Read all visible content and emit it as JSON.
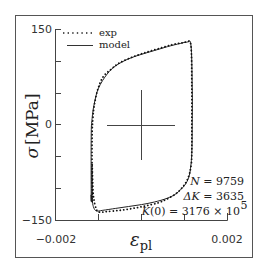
{
  "chart_data": {
    "type": "line",
    "title": "",
    "xlabel": "ε_pl",
    "ylabel": "σ [MPa]",
    "xlim": [
      -0.002,
      0.002
    ],
    "ylim": [
      -150,
      150
    ],
    "x_ticks": [
      -0.002,
      -0.001,
      0,
      0.001,
      0.002
    ],
    "x_tick_labels": [
      "−0.002",
      "0.002"
    ],
    "y_ticks": [
      150,
      100,
      50,
      0,
      -50,
      -100,
      -150
    ],
    "y_tick_labels": [
      "150",
      "0",
      "−150"
    ],
    "grid": false,
    "legend_position": "upper left",
    "series": [
      {
        "name": "exp",
        "style": "dotted",
        "x": [
          -0.00115,
          -0.00115,
          -0.00113,
          -0.0011,
          -0.00102,
          -0.0009,
          -0.0007,
          -0.0005,
          -0.0002,
          0.0001,
          0.0004,
          0.0007,
          0.00095,
          0.00105,
          0.00115,
          0.00117,
          0.00117,
          0.00117,
          0.00116,
          0.00112,
          0.00105,
          0.00095,
          0.0008,
          0.0006,
          0.0004,
          0.0001,
          -0.0002,
          -0.0005,
          -0.0008,
          -0.00098,
          -0.00105,
          -0.00112,
          -0.00115
        ],
        "y": [
          -120,
          -20,
          10,
          30,
          55,
          75,
          88,
          98,
          107,
          114,
          120,
          126,
          129,
          130,
          125,
          60,
          0,
          -40,
          -60,
          -75,
          -88,
          -98,
          -108,
          -116,
          -122,
          -127,
          -131,
          -134,
          -136,
          -137,
          -132,
          -110,
          -60
        ]
      },
      {
        "name": "model",
        "style": "solid",
        "x": [
          -0.00117,
          -0.00117,
          -0.00115,
          -0.0011,
          -0.001,
          -0.0008,
          -0.0006,
          -0.0003,
          0.0,
          0.0003,
          0.0006,
          0.0009,
          0.00105,
          0.00115,
          0.00118,
          0.00118,
          0.00117,
          0.00114,
          0.0011,
          0.001,
          0.0008,
          0.0006,
          0.0003,
          0.0,
          -0.0003,
          -0.0006,
          -0.0009,
          -0.00105,
          -0.00112,
          -0.00117
        ],
        "y": [
          -120,
          -20,
          10,
          33,
          58,
          80,
          93,
          104,
          111,
          117,
          123,
          128,
          130,
          126,
          60,
          0,
          -45,
          -68,
          -82,
          -95,
          -108,
          -115,
          -121,
          -125,
          -128,
          -131,
          -134,
          -135,
          -128,
          -110
        ]
      }
    ],
    "annotations": [
      {
        "text": "N = 9759"
      },
      {
        "text": "ΔK = 3635"
      },
      {
        "text": "K(0) = 3176 × 10^5"
      }
    ],
    "crosshair": {
      "x": 0,
      "y": 0
    }
  },
  "legend": {
    "exp_label": "exp",
    "model_label": "model"
  },
  "axes": {
    "y_top": "150",
    "y_mid": "0",
    "y_bottom": "−150",
    "x_left": "−0.002",
    "x_right": "0.002",
    "ylabel_sigma": "σ",
    "ylabel_unit": "[MPa]",
    "xlabel_main": "ε",
    "xlabel_sub": "pl"
  },
  "annotations": {
    "n_var": "N",
    "n_val": " = 9759",
    "dk_var": "ΔK",
    "dk_val": " = 3635",
    "k0_var": "K",
    "k0_mid": "(0) = 3176 × 10",
    "k0_exp": "5"
  }
}
